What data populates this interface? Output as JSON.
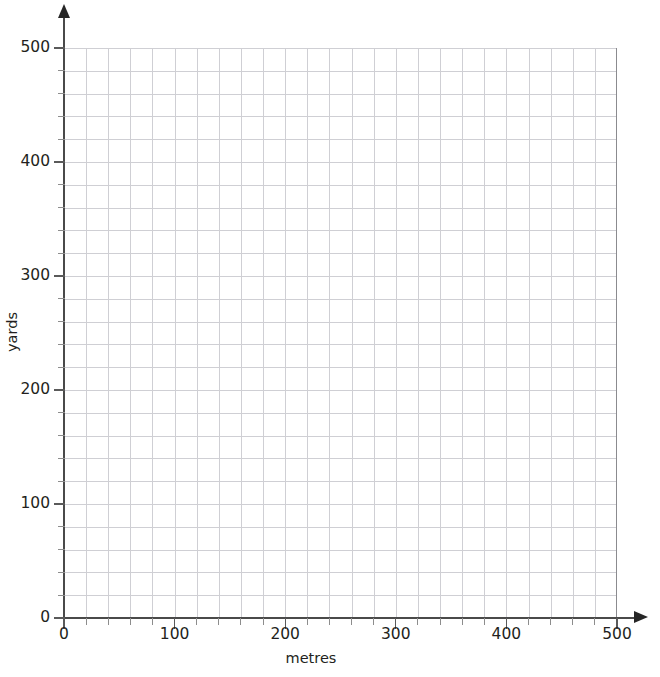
{
  "chart_data": {
    "type": "grid",
    "title": "",
    "subtitle": "",
    "xlabel": "metres",
    "ylabel": "yards",
    "xlim": [
      0,
      500
    ],
    "ylim": [
      0,
      500
    ],
    "x_ticks": [
      0,
      100,
      200,
      300,
      400,
      500
    ],
    "y_ticks": [
      0,
      100,
      200,
      300,
      400,
      500
    ],
    "x_tick_labels": [
      "0",
      "100",
      "200",
      "300",
      "400",
      "500"
    ],
    "y_tick_labels": [
      "0",
      "100",
      "200",
      "300",
      "400",
      "500"
    ],
    "minor_tick_step": 20,
    "minor_divisions_per_major": 5,
    "grid": true,
    "grid_major": true,
    "grid_minor": true,
    "legend": null,
    "series": [],
    "annotations": []
  },
  "axes": {
    "x": {
      "title": "metres",
      "ticks": [
        {
          "value": 0,
          "label": "0"
        },
        {
          "value": 100,
          "label": "100"
        },
        {
          "value": 200,
          "label": "200"
        },
        {
          "value": 300,
          "label": "300"
        },
        {
          "value": 400,
          "label": "400"
        },
        {
          "value": 500,
          "label": "500"
        }
      ],
      "arrow": "arrow-right-icon"
    },
    "y": {
      "title": "yards",
      "ticks": [
        {
          "value": 0,
          "label": "0"
        },
        {
          "value": 100,
          "label": "100"
        },
        {
          "value": 200,
          "label": "200"
        },
        {
          "value": 300,
          "label": "300"
        },
        {
          "value": 400,
          "label": "400"
        },
        {
          "value": 500,
          "label": "500"
        }
      ],
      "arrow": "arrow-up-icon"
    }
  },
  "colors": {
    "background": "#ffffff",
    "axis": "#4a4a4a",
    "arrow": "#262626",
    "tick": "#5a5a5a",
    "tick_minor": "#8d8d8d",
    "grid_major": "#8b8b8f",
    "grid_minor": "#cfcfd4",
    "text": "#231f20"
  }
}
